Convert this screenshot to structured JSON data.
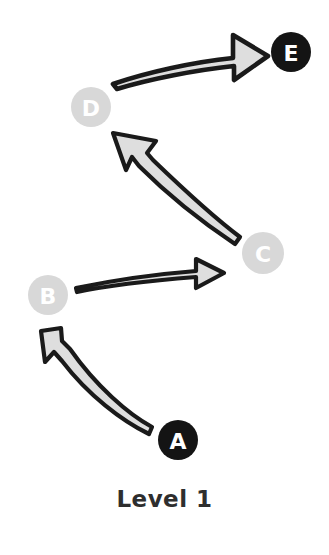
{
  "diagram": {
    "title": "Level 1",
    "caption": "Level 1",
    "type": "flow-sequence",
    "background_color": "#ffffff",
    "node_dark_color": "#141414",
    "node_light_color": "#d8d8d8",
    "node_text_color": "#ffffff",
    "arrow_outline_color": "#1a1a1a",
    "arrow_fill_color": "#dedede",
    "caption_color": "#2e2e2e",
    "nodes": [
      {
        "id": "E",
        "label": "E",
        "style": "dark",
        "cx": 291,
        "cy": 52,
        "r": 20
      },
      {
        "id": "D",
        "label": "D",
        "style": "light",
        "cx": 91,
        "cy": 107,
        "r": 20
      },
      {
        "id": "C",
        "label": "C",
        "style": "light",
        "cx": 263,
        "cy": 253,
        "r": 21
      },
      {
        "id": "B",
        "label": "B",
        "style": "light",
        "cx": 48,
        "cy": 295,
        "r": 20
      },
      {
        "id": "A",
        "label": "A",
        "style": "dark",
        "cx": 178,
        "cy": 440,
        "r": 20
      }
    ],
    "edges": [
      {
        "id": "a-to-b",
        "from": "A",
        "to": "B",
        "direction": "up-left"
      },
      {
        "id": "b-to-c",
        "from": "B",
        "to": "C",
        "direction": "right"
      },
      {
        "id": "c-to-d",
        "from": "C",
        "to": "D",
        "direction": "up-left"
      },
      {
        "id": "d-to-e",
        "from": "D",
        "to": "E",
        "direction": "right-up"
      }
    ]
  }
}
